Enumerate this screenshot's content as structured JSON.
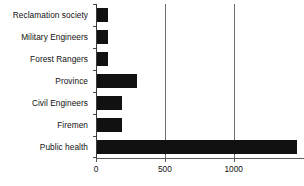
{
  "chart_data": {
    "type": "bar",
    "orientation": "horizontal",
    "title": "",
    "xlabel": "",
    "ylabel": "",
    "categories": [
      "Reclamation society",
      "Military Engineers",
      "Forest Rangers",
      "Province",
      "Civil Engineers",
      "Firemen",
      "Public health"
    ],
    "values": [
      80,
      80,
      80,
      290,
      185,
      185,
      1450
    ],
    "xlim": [
      0,
      1510
    ],
    "ylim": [
      0,
      7
    ],
    "xticks": [
      0,
      500,
      1000
    ],
    "xticklabels": [
      "0",
      "500",
      "1000"
    ],
    "grid": "vertical-at-xticks",
    "legend": null,
    "bar_color": "#111111",
    "axis_color": "#4a4a4a",
    "background": "#ffffff"
  }
}
